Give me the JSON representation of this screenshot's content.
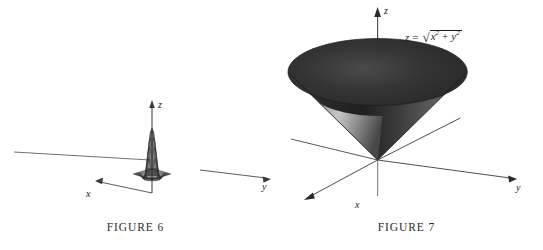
{
  "document": {
    "kind": "textbook-figure-pair",
    "background_color": "#ffffff",
    "ink_color": "#1a1a1a"
  },
  "figures": [
    {
      "id": "figure-6",
      "caption": "FIGURE 6",
      "surface_type": "wireframe-mesh-bump",
      "description": "Gaussian bump mesh surface on a flat grid plane",
      "axes": [
        {
          "name": "x",
          "label": "x",
          "direction": "down-left",
          "arrow": true
        },
        {
          "name": "y",
          "label": "y",
          "direction": "right",
          "arrow": true
        },
        {
          "name": "z",
          "label": "z",
          "direction": "up",
          "arrow": true
        }
      ],
      "equation": null
    },
    {
      "id": "figure-7",
      "caption": "FIGURE 7",
      "surface_type": "shaded-cone",
      "description": "Upper nappe of a circular cone, shaded dark with light interior",
      "axes": [
        {
          "name": "x",
          "label": "x",
          "direction": "down-left",
          "arrow": true
        },
        {
          "name": "y",
          "label": "y",
          "direction": "down-right",
          "arrow": true
        },
        {
          "name": "z",
          "label": "z",
          "direction": "up",
          "arrow": true
        }
      ],
      "equation": {
        "lhs": "z",
        "relation": "=",
        "radical": "√",
        "term_1_base": "x",
        "term_1_exp": "2",
        "operator": "+",
        "term_2_base": "y",
        "term_2_exp": "2",
        "plain": "z = √(x² + y²)"
      }
    }
  ],
  "chart_data": [
    {
      "type": "surface",
      "title": "FIGURE 6",
      "function": "bell-shaped bump (Gaussian-like) over xy-plane",
      "xlabel": "x",
      "ylabel": "y",
      "zlabel": "z",
      "grid": true,
      "mesh_lines_u": 22,
      "mesh_lines_v": 22,
      "peak_height_relative": 1.0,
      "ring_depression": true,
      "shading": "wireframe"
    },
    {
      "type": "surface",
      "title": "FIGURE 7",
      "function": "z = sqrt(x^2 + y^2)",
      "xlabel": "x",
      "ylabel": "y",
      "zlabel": "z",
      "grid": false,
      "shading": "solid-dark-with-light-interior",
      "annotations": [
        "z = √(x² + y²)"
      ]
    }
  ]
}
